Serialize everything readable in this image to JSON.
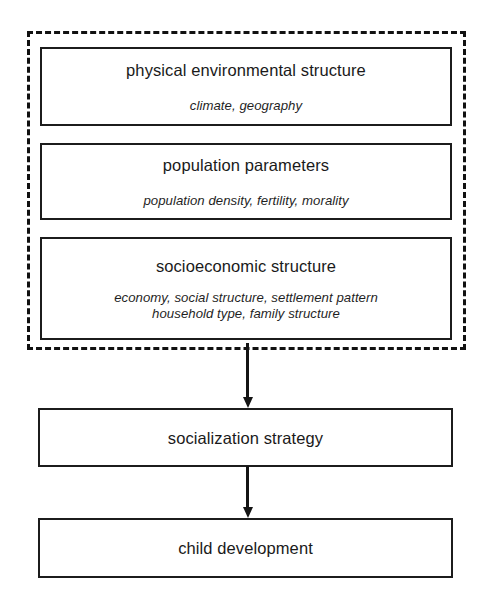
{
  "diagram": {
    "type": "flowchart",
    "group_frame": {
      "style": "dashed",
      "label": "contextual-factors-group"
    },
    "nodes": [
      {
        "id": "physical-environmental-structure",
        "title": "physical environmental structure",
        "subtitle_lines": [
          "climate, geography"
        ]
      },
      {
        "id": "population-parameters",
        "title": "population parameters",
        "subtitle_lines": [
          "population density, fertility, morality"
        ]
      },
      {
        "id": "socioeconomic-structure",
        "title": "socioeconomic structure",
        "subtitle_lines": [
          "economy, social structure, settlement pattern",
          "household type, family structure"
        ]
      },
      {
        "id": "socialization-strategy",
        "title": "socialization strategy",
        "subtitle_lines": []
      },
      {
        "id": "child-development",
        "title": "child development",
        "subtitle_lines": []
      }
    ],
    "edges": [
      {
        "id": "group-to-socialization",
        "from": "contextual-factors-group",
        "to": "socialization-strategy",
        "direction": "down",
        "arrowhead": "filled-triangle"
      },
      {
        "id": "socialization-to-child",
        "from": "socialization-strategy",
        "to": "child-development",
        "direction": "down",
        "arrowhead": "filled-triangle"
      }
    ],
    "colors": {
      "background": "#ffffff",
      "box_border": "#1c1c1c",
      "frame_border": "#111111",
      "arrow": "#141414",
      "text": "#1a1a1a"
    }
  }
}
